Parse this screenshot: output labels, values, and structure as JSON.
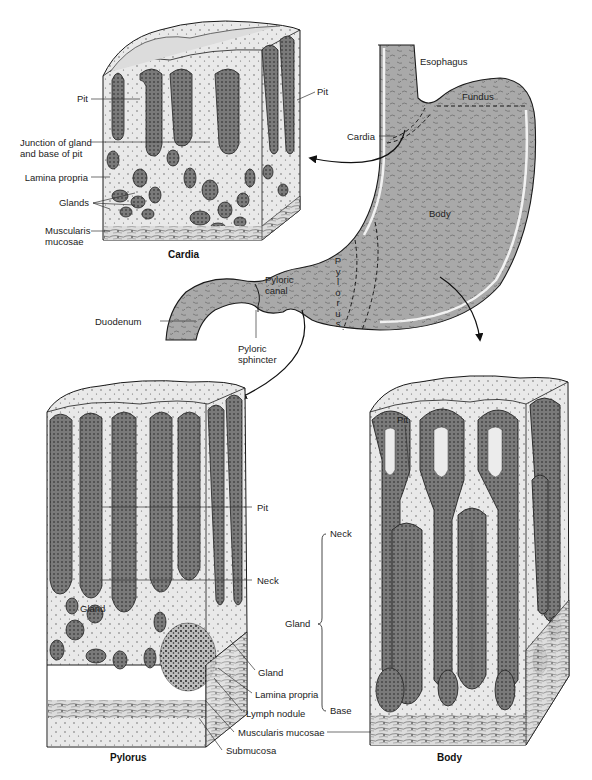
{
  "figure": {
    "colors": {
      "tissue_fill": "#b5b5b5",
      "tissue_dark": "#5a5a5a",
      "epithelium": "#6f6f6f",
      "lamina_light": "#e6e6e6",
      "outline": "#1a1a1a",
      "background": "#ffffff"
    }
  },
  "stomach": {
    "labels": {
      "esophagus": "Esophagus",
      "fundus": "Fundus",
      "cardia": "Cardia",
      "body": "Body",
      "pylorus": "Pylorus",
      "pyloric_canal": "Pyloric canal",
      "pyloric_sphincter": "Pyloric sphincter",
      "duodenum": "Duodenum"
    },
    "pylorus_letters": [
      "P",
      "y",
      "l",
      "o",
      "r",
      "u",
      "s"
    ]
  },
  "cardia_panel": {
    "caption": "Cardia",
    "labels": {
      "pit_left": "Pit",
      "pit_right": "Pit",
      "junction_line1": "Junction of gland",
      "junction_line2": "and base of pit",
      "lamina_propria": "Lamina propria",
      "glands": "Glands",
      "muscularis_line1": "Muscularis",
      "muscularis_line2": "mucosae"
    }
  },
  "pylorus_panel": {
    "caption": "Pylorus",
    "labels": {
      "pit": "Pit",
      "neck": "Neck",
      "gland_inner": "Gland",
      "gland": "Gland",
      "lamina_propria": "Lamina propria",
      "lymph_nodule": "Lymph nodule",
      "muscularis_mucosae": "Muscularis mucosae",
      "submucosa": "Submucosa"
    }
  },
  "body_panel": {
    "caption": "Body",
    "labels": {
      "pit": "Pit",
      "neck": "Neck",
      "gland": "Gland",
      "base": "Base"
    }
  }
}
